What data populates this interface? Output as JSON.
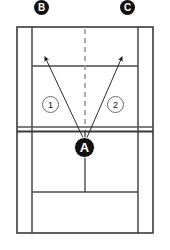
{
  "diagram": {
    "court": {
      "surface_color": "#ffffff",
      "line_color": "#3a3a3a",
      "net_color": "#555555",
      "center_mark_color": "#999999"
    },
    "targets": [
      {
        "id": "B",
        "label": "B",
        "x": 42,
        "y": 7,
        "description": "left deep target"
      },
      {
        "id": "C",
        "label": "C",
        "x": 128,
        "y": 7,
        "description": "right deep target"
      }
    ],
    "player": {
      "id": "A",
      "label": "A",
      "x": 85,
      "y": 148,
      "description": "player position at net center"
    },
    "shots": [
      {
        "id": "1",
        "label": "1",
        "x": 50,
        "y": 104,
        "from": "A",
        "to": "B",
        "description": "crosscourt shot to B"
      },
      {
        "id": "2",
        "label": "2",
        "x": 115,
        "y": 104,
        "from": "A",
        "to": "C",
        "description": "crosscourt shot to C"
      }
    ],
    "arrows": [
      {
        "name": "arrow-to-b",
        "x1": 85,
        "y1": 142,
        "x2": 45,
        "y2": 57
      },
      {
        "name": "arrow-to-c",
        "x1": 85,
        "y1": 142,
        "x2": 122,
        "y2": 57
      }
    ]
  }
}
